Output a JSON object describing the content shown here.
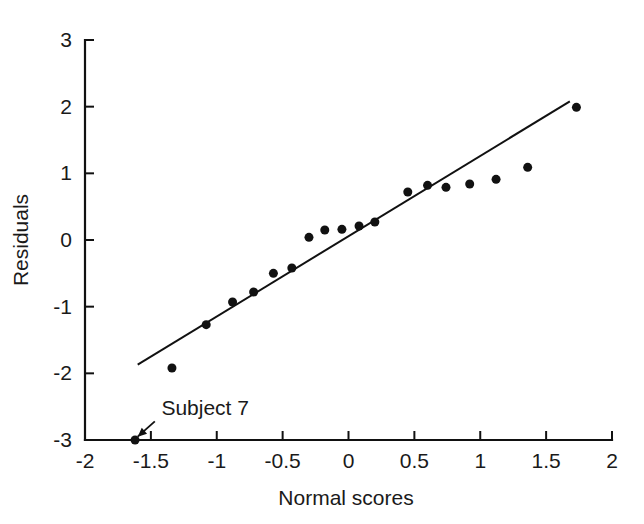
{
  "chart_data": {
    "type": "scatter",
    "title": "",
    "subtitle": "",
    "xlabel": "Normal scores",
    "ylabel": "Residuals",
    "xlim": [
      -2,
      2
    ],
    "ylim": [
      -3,
      3
    ],
    "grid": false,
    "legend": "none",
    "xticks": [
      -2,
      -1.5,
      -1,
      -0.5,
      0,
      0.5,
      1,
      1.5,
      2
    ],
    "xtick_labels": [
      "-2",
      "-1.5",
      "-1",
      "-0.5",
      "0",
      "0.5",
      "1",
      "1.5",
      "2"
    ],
    "yticks": [
      -3,
      -2,
      -1,
      0,
      1,
      2,
      3
    ],
    "ytick_labels": [
      "-3",
      "-2",
      "-1",
      "0",
      "1",
      "2",
      "3"
    ],
    "marker": "filled-circle",
    "marker_color": "#111111",
    "marker_size": 9,
    "x": [
      -1.62,
      -1.34,
      -1.08,
      -0.88,
      -0.72,
      -0.57,
      -0.43,
      -0.3,
      -0.18,
      -0.05,
      0.08,
      0.2,
      0.45,
      0.6,
      0.74,
      0.92,
      1.12,
      1.36,
      1.73
    ],
    "y": [
      -3.0,
      -1.92,
      -1.27,
      -0.93,
      -0.78,
      -0.5,
      -0.42,
      0.04,
      0.15,
      0.16,
      0.21,
      0.27,
      0.72,
      0.82,
      0.79,
      0.84,
      0.91,
      1.09,
      1.99
    ],
    "points": [
      {
        "x": -1.62,
        "y": -3.0
      },
      {
        "x": -1.34,
        "y": -1.92
      },
      {
        "x": -1.08,
        "y": -1.27
      },
      {
        "x": -0.88,
        "y": -0.93
      },
      {
        "x": -0.72,
        "y": -0.78
      },
      {
        "x": -0.57,
        "y": -0.5
      },
      {
        "x": -0.43,
        "y": -0.42
      },
      {
        "x": -0.3,
        "y": 0.04
      },
      {
        "x": -0.18,
        "y": 0.15
      },
      {
        "x": -0.05,
        "y": 0.16
      },
      {
        "x": 0.08,
        "y": 0.21
      },
      {
        "x": 0.2,
        "y": 0.27
      },
      {
        "x": 0.45,
        "y": 0.72
      },
      {
        "x": 0.6,
        "y": 0.82
      },
      {
        "x": 0.74,
        "y": 0.79
      },
      {
        "x": 0.92,
        "y": 0.84
      },
      {
        "x": 1.12,
        "y": 0.91
      },
      {
        "x": 1.36,
        "y": 1.09
      },
      {
        "x": 1.73,
        "y": 1.99
      }
    ],
    "reference_line": {
      "name": "fitted-reference-line",
      "x1": -1.6,
      "y1": -1.87,
      "x2": 1.68,
      "y2": 2.08,
      "color": "#111111",
      "width": 2
    },
    "annotations": [
      {
        "name": "subject-7-annotation",
        "text": "Subject 7",
        "text_x": -1.42,
        "text_y": -2.62,
        "arrow_from_x": -1.47,
        "arrow_from_y": -2.72,
        "arrow_to_x": -1.6,
        "arrow_to_y": -2.95
      }
    ]
  },
  "axes": {
    "x_axis_name": "x-axis",
    "y_axis_name": "y-axis",
    "axis_color": "#111111"
  }
}
